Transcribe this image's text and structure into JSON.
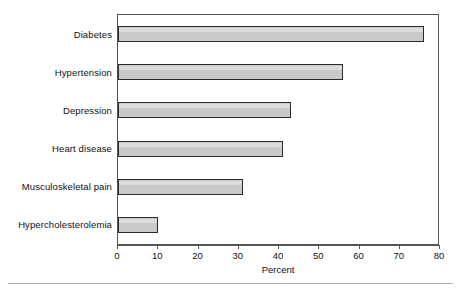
{
  "chart_data": {
    "type": "bar",
    "orientation": "horizontal",
    "title": "",
    "subtitle": "",
    "xlabel": "Percent",
    "ylabel": "",
    "categories": [
      "Diabetes",
      "Hypertension",
      "Depression",
      "Heart disease",
      "Musculoskeletal pain",
      "Hypercholesterolemia"
    ],
    "values": [
      76,
      56,
      43,
      41,
      31,
      10
    ],
    "xlim": [
      0,
      80
    ],
    "xticks": [
      0,
      10,
      20,
      30,
      40,
      50,
      60,
      70,
      80
    ],
    "xticklabels": [
      "0",
      "10",
      "20",
      "30",
      "40",
      "50",
      "60",
      "70",
      "80"
    ],
    "grid": false,
    "legend": null,
    "bar_fill_color": "#c9c9c9",
    "bar_edge_color": "#2b2b2b",
    "axis_color": "#555555",
    "background_color": "#ffffff"
  }
}
